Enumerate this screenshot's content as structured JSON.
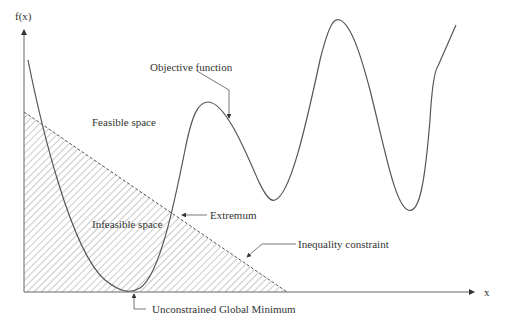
{
  "diagram": {
    "type": "constrained-optimization-illustration",
    "axes": {
      "y_label": "f(x)",
      "x_label": "x"
    },
    "labels": {
      "objective_function": "Objective function",
      "feasible_space": "Feasible space",
      "infeasible_space": "Infeasible space",
      "extremum": "Extremum",
      "inequality_constraint": "Inequality constraint",
      "unconstrained_global_minimum": "Unconstrained Global Minimum"
    },
    "colors": {
      "line": "#555555",
      "hatch": "#777777",
      "text": "#333333",
      "background": "#ffffff"
    }
  }
}
